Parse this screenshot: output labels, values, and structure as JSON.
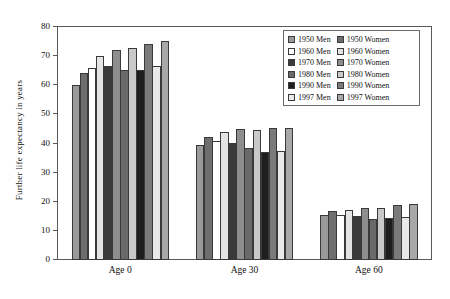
{
  "chart_data": {
    "type": "bar",
    "title": "",
    "xlabel": "",
    "ylabel": "Further life expectancy in years",
    "categories": [
      "Age 0",
      "Age 30",
      "Age 60"
    ],
    "ylim": [
      0,
      80
    ],
    "yticks": [
      0,
      10,
      20,
      30,
      40,
      50,
      60,
      70,
      80
    ],
    "grid": false,
    "legend_position": "top-right",
    "series": [
      {
        "name": "1950 Men",
        "color": "#9a9a9a",
        "values": [
          60.0,
          39.5,
          15.4
        ]
      },
      {
        "name": "1950 Women",
        "color": "#6e6e6e",
        "values": [
          64.2,
          42.4,
          17.0
        ]
      },
      {
        "name": "1960 Men",
        "color": "#ffffff",
        "values": [
          65.8,
          41.0,
          15.5
        ]
      },
      {
        "name": "1960 Women",
        "color": "#e4e4e4",
        "values": [
          70.2,
          44.1,
          17.2
        ]
      },
      {
        "name": "1970 Men",
        "color": "#3a3a3a",
        "values": [
          66.5,
          40.2,
          15.0
        ]
      },
      {
        "name": "1970 Women",
        "color": "#8e8e8e",
        "values": [
          72.0,
          45.1,
          18.0
        ]
      },
      {
        "name": "1980 Men",
        "color": "#6a6a6a",
        "values": [
          65.4,
          38.5,
          14.2
        ]
      },
      {
        "name": "1980 Women",
        "color": "#c9c9c9",
        "values": [
          72.8,
          44.6,
          18.0
        ]
      },
      {
        "name": "1990 Men",
        "color": "#1e1e1e",
        "values": [
          65.2,
          37.2,
          14.5
        ]
      },
      {
        "name": "1990 Women",
        "color": "#7a7a7a",
        "values": [
          74.0,
          45.2,
          18.8
        ]
      },
      {
        "name": "1997 Men",
        "color": "#e9e9e9",
        "values": [
          66.5,
          37.3,
          14.7
        ]
      },
      {
        "name": "1997 Women",
        "color": "#a8a8a8",
        "values": [
          75.1,
          45.3,
          19.3
        ]
      }
    ]
  },
  "legend": {
    "men_column": [
      {
        "label": "1950 Men",
        "color": "#9a9a9a"
      },
      {
        "label": "1960 Men",
        "color": "#ffffff"
      },
      {
        "label": "1970 Men",
        "color": "#3a3a3a"
      },
      {
        "label": "1980 Men",
        "color": "#6a6a6a"
      },
      {
        "label": "1990 Men",
        "color": "#1e1e1e"
      },
      {
        "label": "1997 Men",
        "color": "#e9e9e9"
      }
    ],
    "women_column": [
      {
        "label": "1950 Women",
        "color": "#6e6e6e"
      },
      {
        "label": "1960 Women",
        "color": "#e4e4e4"
      },
      {
        "label": "1970 Women",
        "color": "#8e8e8e"
      },
      {
        "label": "1980 Women",
        "color": "#c9c9c9"
      },
      {
        "label": "1990 Women",
        "color": "#7a7a7a"
      },
      {
        "label": "1997 Women",
        "color": "#a8a8a8"
      }
    ]
  },
  "axis": {
    "y_title": "Further life expectancy in years",
    "y_tick_labels": [
      "0",
      "10",
      "20",
      "30",
      "40",
      "50",
      "60",
      "70",
      "80"
    ],
    "x_tick_labels": [
      "Age 0",
      "Age 30",
      "Age 60"
    ]
  }
}
